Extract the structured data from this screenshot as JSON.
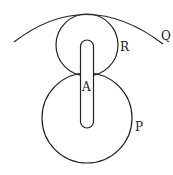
{
  "diagram": {
    "labels": {
      "Q": "Q",
      "R": "R",
      "A": "A",
      "P": "P"
    },
    "elements": [
      {
        "id": "Q",
        "type": "arc",
        "description": "large outer circular arc"
      },
      {
        "id": "R",
        "type": "circle",
        "description": "small upper circle tangent to arc Q"
      },
      {
        "id": "P",
        "type": "circle",
        "description": "large lower circle"
      },
      {
        "id": "A",
        "type": "slot",
        "description": "vertical rounded slot/rod linking R and P"
      }
    ],
    "colors": {
      "line": "#222222",
      "background": "#ffffff"
    }
  }
}
